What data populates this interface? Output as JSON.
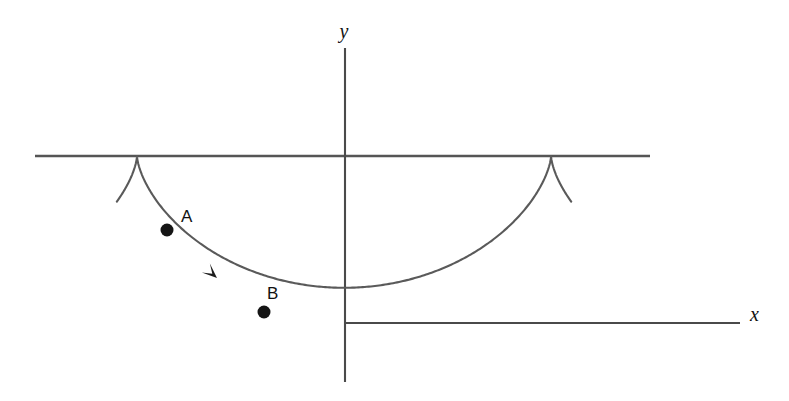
{
  "figure": {
    "background_color": "#ffffff",
    "curve_color": "#5a5a5a",
    "axis_color": "#4a4a4a",
    "marker_color": "#151515",
    "width": 789,
    "height": 401
  },
  "axes": {
    "y_axis": {
      "label": "y",
      "x": 345,
      "y_top": 48,
      "y_bottom": 382,
      "label_x": 344,
      "label_y": 38
    },
    "x_axis": {
      "label": "x",
      "y": 323,
      "x_left": 345,
      "x_right": 740,
      "label_x": 750,
      "label_y": 321
    }
  },
  "guide": {
    "name": "rolling-line",
    "y": 156,
    "x_left": 35,
    "x_right": 650
  },
  "points": [
    {
      "label": "A",
      "cx": 167,
      "cy": 230,
      "r": 6.5,
      "label_x": 181,
      "label_y": 222
    },
    {
      "label": "B",
      "cx": 264,
      "cy": 312,
      "r": 6.5,
      "label_x": 267,
      "label_y": 299
    }
  ],
  "arrow": {
    "name": "direction-of-motion-arrow",
    "tip_x": 217,
    "tip_y": 278,
    "angle_deg": 42
  },
  "chart_data": {
    "type": "line",
    "xlabel": "x",
    "ylabel": "y",
    "grid": false,
    "legend_position": "none",
    "annotations": [
      "A",
      "B",
      "direction arrow"
    ],
    "parametric": {
      "x_expr": "a*(t - sin t)",
      "y_expr": "-a*(1 - cos t)",
      "a_pixels": 65.9,
      "t_range_deg": [
        -72,
        432
      ],
      "cusp_period_deg": 360
    },
    "features": {
      "cusp_left": {
        "x": 137,
        "y": 156
      },
      "cusp_right": {
        "x": 551,
        "y": 156
      },
      "minimum": {
        "x": 345,
        "y": 323
      },
      "tail_left_end": {
        "x": 88,
        "y": 255
      },
      "tail_right_end": {
        "x": 600,
        "y": 256
      }
    },
    "series": [
      {
        "name": "cycloid",
        "points": [
          [
            88,
            255
          ],
          [
            95,
            240
          ],
          [
            103,
            223
          ],
          [
            112,
            205
          ],
          [
            121,
            188
          ],
          [
            129,
            172
          ],
          [
            137,
            156
          ],
          [
            145,
            172
          ],
          [
            153,
            186
          ],
          [
            161,
            200
          ],
          [
            170,
            214
          ],
          [
            180,
            227
          ],
          [
            191,
            240
          ],
          [
            203,
            253
          ],
          [
            216,
            266
          ],
          [
            231,
            279
          ],
          [
            247,
            291
          ],
          [
            264,
            302
          ],
          [
            283,
            311
          ],
          [
            303,
            318
          ],
          [
            324,
            322
          ],
          [
            345,
            323
          ],
          [
            366,
            322
          ],
          [
            387,
            318
          ],
          [
            407,
            311
          ],
          [
            426,
            302
          ],
          [
            443,
            291
          ],
          [
            459,
            279
          ],
          [
            474,
            266
          ],
          [
            487,
            253
          ],
          [
            499,
            240
          ],
          [
            510,
            227
          ],
          [
            520,
            214
          ],
          [
            529,
            200
          ],
          [
            537,
            186
          ],
          [
            545,
            172
          ],
          [
            551,
            156
          ],
          [
            559,
            172
          ],
          [
            567,
            188
          ],
          [
            576,
            205
          ],
          [
            585,
            223
          ],
          [
            593,
            240
          ],
          [
            600,
            256
          ]
        ]
      }
    ]
  }
}
